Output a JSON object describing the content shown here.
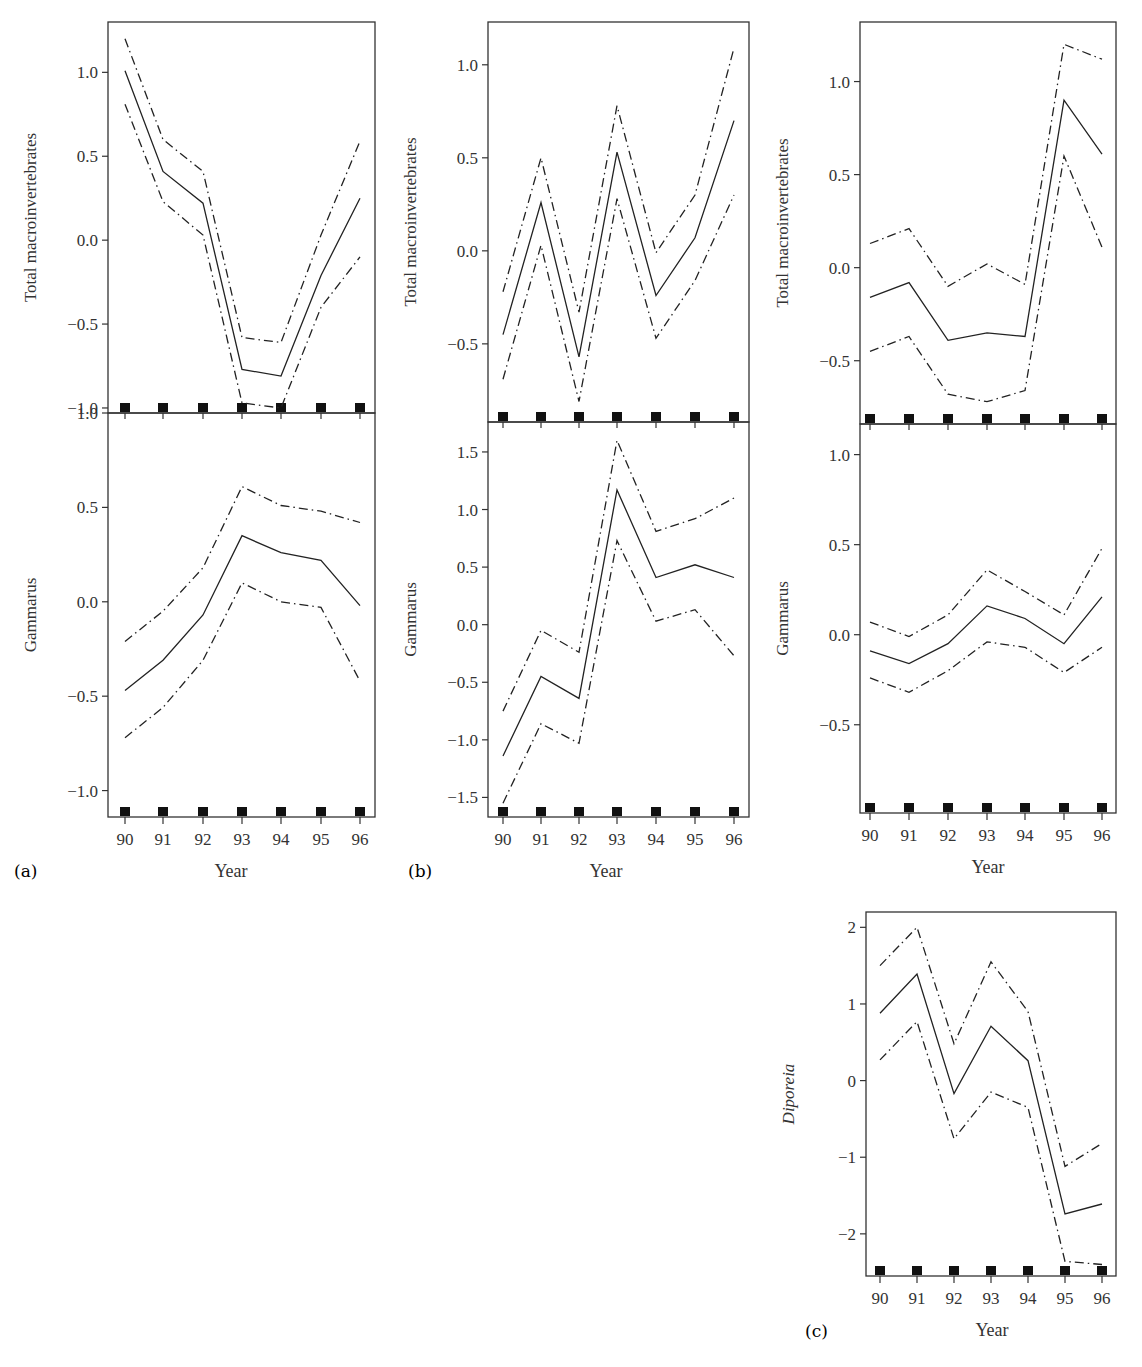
{
  "figure": {
    "panel_labels": [
      "(a)",
      "(b)",
      "(c)"
    ],
    "xlabel": "Year",
    "x_ticks": [
      "90",
      "91",
      "92",
      "93",
      "94",
      "95",
      "96"
    ]
  },
  "chart_data": [
    {
      "type": "line",
      "panel": "a",
      "position": "top",
      "ylabel": "Total macroinvertebrates",
      "x": [
        90,
        91,
        92,
        93,
        94,
        95,
        96
      ],
      "yticks": [
        -1.0,
        -0.5,
        0.0,
        0.5,
        1.0
      ],
      "ytick_labels": [
        "−1.0",
        "−0.5",
        "0.0",
        "0.5",
        "1.0"
      ],
      "ylim": [
        -1.03,
        1.3
      ],
      "series": [
        {
          "name": "fit",
          "style": "solid",
          "values": [
            1.01,
            0.41,
            0.22,
            -0.77,
            -0.81,
            -0.21,
            0.25
          ]
        },
        {
          "name": "upper",
          "style": "dashdot",
          "values": [
            1.2,
            0.6,
            0.41,
            -0.58,
            -0.61,
            0.03,
            0.59
          ]
        },
        {
          "name": "lower",
          "style": "dashdot",
          "values": [
            0.81,
            0.23,
            0.03,
            -0.97,
            -1.0,
            -0.4,
            -0.1
          ]
        }
      ]
    },
    {
      "type": "line",
      "panel": "a",
      "position": "bottom",
      "ylabel": "Gammarus",
      "x": [
        90,
        91,
        92,
        93,
        94,
        95,
        96
      ],
      "yticks": [
        -1.0,
        -0.5,
        0.0,
        0.5,
        1.0
      ],
      "ytick_labels": [
        "−1.0",
        "−0.5",
        "0.0",
        "0.5",
        "1.0"
      ],
      "ylim": [
        -1.14,
        1.0
      ],
      "series": [
        {
          "name": "fit",
          "style": "solid",
          "values": [
            -0.47,
            -0.31,
            -0.07,
            0.35,
            0.26,
            0.22,
            -0.02
          ]
        },
        {
          "name": "upper",
          "style": "dashdot",
          "values": [
            -0.21,
            -0.05,
            0.18,
            0.61,
            0.51,
            0.48,
            0.42
          ]
        },
        {
          "name": "lower",
          "style": "dashdot",
          "values": [
            -0.72,
            -0.56,
            -0.31,
            0.1,
            0.0,
            -0.03,
            -0.42
          ]
        }
      ]
    },
    {
      "type": "line",
      "panel": "b",
      "position": "top",
      "ylabel": "Total macroinvertebrates",
      "x": [
        90,
        91,
        92,
        93,
        94,
        95,
        96
      ],
      "yticks": [
        -0.5,
        0.0,
        0.5,
        1.0
      ],
      "ytick_labels": [
        "−0.5",
        "0.0",
        "0.5",
        "1.0"
      ],
      "ylim": [
        -0.92,
        1.23
      ],
      "series": [
        {
          "name": "fit",
          "style": "solid",
          "values": [
            -0.45,
            0.26,
            -0.57,
            0.53,
            -0.24,
            0.07,
            0.7
          ]
        },
        {
          "name": "upper",
          "style": "dashdot",
          "values": [
            -0.22,
            0.5,
            -0.33,
            0.78,
            -0.01,
            0.3,
            1.09
          ]
        },
        {
          "name": "lower",
          "style": "dashdot",
          "values": [
            -0.69,
            0.03,
            -0.81,
            0.28,
            -0.47,
            -0.16,
            0.3
          ]
        }
      ]
    },
    {
      "type": "line",
      "panel": "b",
      "position": "bottom",
      "ylabel": "Gammarus",
      "x": [
        90,
        91,
        92,
        93,
        94,
        95,
        96
      ],
      "yticks": [
        -1.5,
        -1.0,
        -0.5,
        0.0,
        0.5,
        1.0,
        1.5
      ],
      "ytick_labels": [
        "−1.5",
        "−1.0",
        "−0.5",
        "0.0",
        "0.5",
        "1.0",
        "1.5"
      ],
      "ylim": [
        -1.67,
        1.76
      ],
      "series": [
        {
          "name": "fit",
          "style": "solid",
          "values": [
            -1.14,
            -0.45,
            -0.64,
            1.17,
            0.41,
            0.52,
            0.41
          ]
        },
        {
          "name": "upper",
          "style": "dashdot",
          "values": [
            -0.75,
            -0.05,
            -0.24,
            1.6,
            0.81,
            0.92,
            1.1
          ]
        },
        {
          "name": "lower",
          "style": "dashdot",
          "values": [
            -1.55,
            -0.86,
            -1.03,
            0.73,
            0.03,
            0.13,
            -0.27
          ]
        }
      ]
    },
    {
      "type": "line",
      "panel": "c",
      "position": "top",
      "ylabel": "Total macroinvertebrates",
      "x": [
        90,
        91,
        92,
        93,
        94,
        95,
        96
      ],
      "yticks": [
        -0.5,
        0.0,
        0.5,
        1.0
      ],
      "ytick_labels": [
        "−0.5",
        "0.0",
        "0.5",
        "1.0"
      ],
      "ylim": [
        -0.84,
        1.32
      ],
      "series": [
        {
          "name": "fit",
          "style": "solid",
          "values": [
            -0.16,
            -0.08,
            -0.39,
            -0.35,
            -0.37,
            0.9,
            0.61
          ]
        },
        {
          "name": "upper",
          "style": "dashdot",
          "values": [
            0.13,
            0.21,
            -0.1,
            0.02,
            -0.09,
            1.2,
            1.12
          ]
        },
        {
          "name": "lower",
          "style": "dashdot",
          "values": [
            -0.45,
            -0.37,
            -0.68,
            -0.72,
            -0.66,
            0.6,
            0.11
          ]
        }
      ]
    },
    {
      "type": "line",
      "panel": "c",
      "position": "bottom",
      "ylabel": "Gammarus",
      "x": [
        90,
        91,
        92,
        93,
        94,
        95,
        96
      ],
      "yticks": [
        -0.5,
        0.0,
        0.5,
        1.0
      ],
      "ytick_labels": [
        "−0.5",
        "0.0",
        "0.5",
        "1.0"
      ],
      "ylim": [
        -0.99,
        1.17
      ],
      "series": [
        {
          "name": "fit",
          "style": "solid",
          "values": [
            -0.09,
            -0.16,
            -0.05,
            0.16,
            0.09,
            -0.05,
            0.21
          ]
        },
        {
          "name": "upper",
          "style": "dashdot",
          "values": [
            0.07,
            -0.01,
            0.11,
            0.36,
            0.24,
            0.11,
            0.48
          ]
        },
        {
          "name": "lower",
          "style": "dashdot",
          "values": [
            -0.24,
            -0.32,
            -0.2,
            -0.04,
            -0.07,
            -0.21,
            -0.07
          ]
        }
      ]
    },
    {
      "type": "line",
      "panel": "c",
      "position": "extra",
      "ylabel": "Diporeia",
      "ylabel_italic": true,
      "x": [
        90,
        91,
        92,
        93,
        94,
        95,
        96
      ],
      "yticks": [
        -2,
        -1,
        0,
        1,
        2
      ],
      "ytick_labels": [
        "−2",
        "−1",
        "0",
        "1",
        "2"
      ],
      "ylim": [
        -2.55,
        2.2
      ],
      "series": [
        {
          "name": "fit",
          "style": "solid",
          "values": [
            0.88,
            1.39,
            -0.17,
            0.71,
            0.26,
            -1.74,
            -1.61
          ]
        },
        {
          "name": "upper",
          "style": "dashdot",
          "values": [
            1.5,
            2.0,
            0.48,
            1.55,
            0.9,
            -1.12,
            -0.82
          ]
        },
        {
          "name": "lower",
          "style": "dashdot",
          "values": [
            0.27,
            0.77,
            -0.76,
            -0.15,
            -0.35,
            -2.36,
            -2.4
          ]
        }
      ]
    }
  ]
}
